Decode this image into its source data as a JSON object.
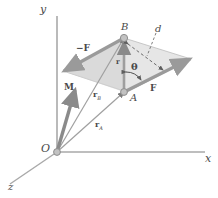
{
  "figure": {
    "type": "vector-mechanics-diagram",
    "title_semantics": "couple-moment-parallelogram",
    "background": "#ffffff",
    "stroke_color": "#8a8a8a",
    "fill_color": "#d8d8d8",
    "arrow_color": "#9a9a9a",
    "label_color": "#4a4a4a"
  },
  "axes": {
    "x_label": "x",
    "y_label": "y",
    "z_label": "z"
  },
  "points": {
    "origin_label": "O",
    "a_label": "A",
    "b_label": "B"
  },
  "vectors": {
    "force_positive": "F",
    "force_negative": "−F",
    "moment": "M",
    "r": "r",
    "r_a_main": "r",
    "r_a_sub": "A",
    "r_b_main": "r",
    "r_b_sub": "B"
  },
  "annotations": {
    "distance": "d",
    "angle": "θ"
  }
}
